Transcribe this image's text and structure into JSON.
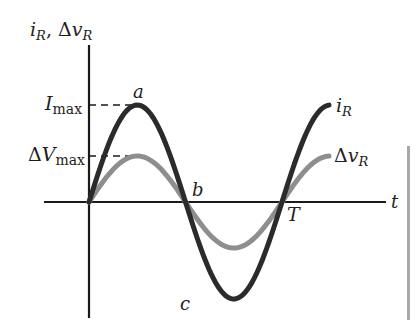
{
  "diagram": {
    "axes": {
      "y_label": {
        "var1": "i",
        "sub1": "R",
        "sep": ", ",
        "delta": "Δ",
        "var2": "v",
        "sub2": "R"
      },
      "x_label": "t"
    },
    "levels": {
      "i_max": {
        "main": "I",
        "sub": "max"
      },
      "v_max": {
        "delta": "Δ",
        "main": "V",
        "sub": "max"
      }
    },
    "points": {
      "a": "a",
      "b": "b",
      "c": "c",
      "T": "T"
    },
    "curves": [
      {
        "name": "i_R",
        "label_var": "i",
        "label_sub": "R",
        "color": "#2b2b2b",
        "amplitude": 97,
        "description": "current, larger amplitude"
      },
      {
        "name": "Δv_R",
        "label_delta": "Δ",
        "label_var": "v",
        "label_sub": "R",
        "color": "#8e8e8e",
        "amplitude": 46,
        "description": "voltage, smaller amplitude, in phase with current"
      }
    ],
    "colors": {
      "axis": "#1a1a1a",
      "current": "#2b2b2b",
      "voltage": "#8e8e8e",
      "side_bar": "#9a9a9a"
    }
  }
}
